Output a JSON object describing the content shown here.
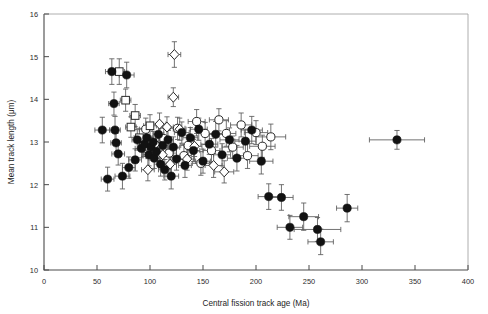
{
  "chart_data": {
    "type": "scatter",
    "title": "",
    "xlabel": "Central fission track age (Ma)",
    "ylabel": "Mean track length (μm)",
    "xlim": [
      0,
      400
    ],
    "ylim": [
      10,
      16
    ],
    "xticks": [
      0,
      50,
      100,
      150,
      200,
      250,
      300,
      350,
      400
    ],
    "yticks": [
      10,
      11,
      12,
      13,
      14,
      15,
      16
    ],
    "xticklabels": [
      "0",
      "50",
      "100",
      "150",
      "200",
      "250",
      "300",
      "350",
      "400"
    ],
    "yticklabels": [
      "10",
      "11",
      "12",
      "13",
      "14",
      "15",
      "16"
    ],
    "grid": false,
    "legend": "none",
    "error_bars": "x and y",
    "marker_types": [
      "filled-circle",
      "open-circle",
      "open-square",
      "open-diamond"
    ],
    "series": [
      {
        "name": "filled-circle",
        "marker": "filled-circle",
        "points": [
          {
            "x": 55,
            "y": 13.28,
            "xerr": 7,
            "yerr": 0.3
          },
          {
            "x": 60,
            "y": 12.13,
            "xerr": 6,
            "yerr": 0.28
          },
          {
            "x": 64,
            "y": 14.65,
            "xerr": 6,
            "yerr": 0.3
          },
          {
            "x": 66,
            "y": 13.9,
            "xerr": 5,
            "yerr": 0.27
          },
          {
            "x": 67,
            "y": 13.28,
            "xerr": 5,
            "yerr": 0.32
          },
          {
            "x": 68,
            "y": 12.98,
            "xerr": 5,
            "yerr": 0.22
          },
          {
            "x": 70,
            "y": 12.72,
            "xerr": 6,
            "yerr": 0.26
          },
          {
            "x": 74,
            "y": 12.2,
            "xerr": 7,
            "yerr": 0.3
          },
          {
            "x": 78,
            "y": 14.57,
            "xerr": 7,
            "yerr": 0.3
          },
          {
            "x": 80,
            "y": 12.4,
            "xerr": 6,
            "yerr": 0.25
          },
          {
            "x": 86,
            "y": 12.58,
            "xerr": 6,
            "yerr": 0.26
          },
          {
            "x": 88,
            "y": 13.05,
            "xerr": 5,
            "yerr": 0.24
          },
          {
            "x": 92,
            "y": 12.85,
            "xerr": 6,
            "yerr": 0.22
          },
          {
            "x": 95,
            "y": 12.95,
            "xerr": 5,
            "yerr": 0.2
          },
          {
            "x": 97,
            "y": 13.1,
            "xerr": 5,
            "yerr": 0.24
          },
          {
            "x": 99,
            "y": 12.7,
            "xerr": 6,
            "yerr": 0.26
          },
          {
            "x": 101,
            "y": 12.88,
            "xerr": 5,
            "yerr": 0.22
          },
          {
            "x": 103,
            "y": 13.0,
            "xerr": 6,
            "yerr": 0.25
          },
          {
            "x": 104,
            "y": 12.62,
            "xerr": 5,
            "yerr": 0.24
          },
          {
            "x": 106,
            "y": 12.78,
            "xerr": 6,
            "yerr": 0.22
          },
          {
            "x": 108,
            "y": 13.18,
            "xerr": 5,
            "yerr": 0.26
          },
          {
            "x": 110,
            "y": 12.48,
            "xerr": 6,
            "yerr": 0.28
          },
          {
            "x": 112,
            "y": 12.92,
            "xerr": 5,
            "yerr": 0.22
          },
          {
            "x": 114,
            "y": 12.35,
            "xerr": 6,
            "yerr": 0.24
          },
          {
            "x": 117,
            "y": 13.05,
            "xerr": 5,
            "yerr": 0.22
          },
          {
            "x": 120,
            "y": 12.2,
            "xerr": 7,
            "yerr": 0.3
          },
          {
            "x": 122,
            "y": 12.88,
            "xerr": 6,
            "yerr": 0.24
          },
          {
            "x": 125,
            "y": 12.6,
            "xerr": 6,
            "yerr": 0.26
          },
          {
            "x": 130,
            "y": 13.22,
            "xerr": 7,
            "yerr": 0.25
          },
          {
            "x": 133,
            "y": 12.45,
            "xerr": 6,
            "yerr": 0.28
          },
          {
            "x": 138,
            "y": 13.1,
            "xerr": 7,
            "yerr": 0.24
          },
          {
            "x": 141,
            "y": 12.8,
            "xerr": 6,
            "yerr": 0.26
          },
          {
            "x": 146,
            "y": 13.3,
            "xerr": 8,
            "yerr": 0.26
          },
          {
            "x": 150,
            "y": 12.55,
            "xerr": 7,
            "yerr": 0.28
          },
          {
            "x": 156,
            "y": 12.95,
            "xerr": 8,
            "yerr": 0.24
          },
          {
            "x": 162,
            "y": 13.18,
            "xerr": 8,
            "yerr": 0.3
          },
          {
            "x": 168,
            "y": 12.7,
            "xerr": 8,
            "yerr": 0.26
          },
          {
            "x": 175,
            "y": 13.05,
            "xerr": 9,
            "yerr": 0.28
          },
          {
            "x": 182,
            "y": 12.62,
            "xerr": 9,
            "yerr": 0.3
          },
          {
            "x": 190,
            "y": 13.02,
            "xerr": 10,
            "yerr": 0.28
          },
          {
            "x": 196,
            "y": 13.28,
            "xerr": 10,
            "yerr": 0.32
          },
          {
            "x": 205,
            "y": 12.55,
            "xerr": 11,
            "yerr": 0.3
          },
          {
            "x": 212,
            "y": 11.72,
            "xerr": 10,
            "yerr": 0.3
          },
          {
            "x": 224,
            "y": 11.7,
            "xerr": 11,
            "yerr": 0.3
          },
          {
            "x": 232,
            "y": 11.0,
            "xerr": 12,
            "yerr": 0.28
          },
          {
            "x": 245,
            "y": 11.25,
            "xerr": 14,
            "yerr": 0.32
          },
          {
            "x": 258,
            "y": 10.95,
            "xerr": 22,
            "yerr": 0.28
          },
          {
            "x": 261,
            "y": 10.66,
            "xerr": 12,
            "yerr": 0.3
          },
          {
            "x": 286,
            "y": 11.45,
            "xerr": 10,
            "yerr": 0.32
          },
          {
            "x": 333,
            "y": 13.05,
            "xerr": 26,
            "yerr": 0.22
          }
        ]
      },
      {
        "name": "open-circle",
        "marker": "open-circle",
        "points": [
          {
            "x": 96,
            "y": 13.3,
            "xerr": 6,
            "yerr": 0.26
          },
          {
            "x": 113,
            "y": 13.08,
            "xerr": 7,
            "yerr": 0.24
          },
          {
            "x": 126,
            "y": 13.32,
            "xerr": 7,
            "yerr": 0.26
          },
          {
            "x": 136,
            "y": 12.92,
            "xerr": 7,
            "yerr": 0.24
          },
          {
            "x": 144,
            "y": 13.48,
            "xerr": 8,
            "yerr": 0.28
          },
          {
            "x": 152,
            "y": 13.2,
            "xerr": 8,
            "yerr": 0.26
          },
          {
            "x": 158,
            "y": 12.8,
            "xerr": 8,
            "yerr": 0.28
          },
          {
            "x": 165,
            "y": 13.52,
            "xerr": 9,
            "yerr": 0.26
          },
          {
            "x": 172,
            "y": 13.2,
            "xerr": 9,
            "yerr": 0.3
          },
          {
            "x": 178,
            "y": 12.88,
            "xerr": 10,
            "yerr": 0.26
          },
          {
            "x": 186,
            "y": 13.4,
            "xerr": 10,
            "yerr": 0.28
          },
          {
            "x": 192,
            "y": 12.68,
            "xerr": 10,
            "yerr": 0.3
          },
          {
            "x": 200,
            "y": 13.22,
            "xerr": 11,
            "yerr": 0.28
          },
          {
            "x": 206,
            "y": 12.9,
            "xerr": 12,
            "yerr": 0.26
          },
          {
            "x": 214,
            "y": 13.12,
            "xerr": 14,
            "yerr": 0.3
          },
          {
            "x": 148,
            "y": 12.5,
            "xerr": 8,
            "yerr": 0.28
          },
          {
            "x": 132,
            "y": 12.68,
            "xerr": 7,
            "yerr": 0.26
          },
          {
            "x": 118,
            "y": 12.74,
            "xerr": 7,
            "yerr": 0.24
          }
        ]
      },
      {
        "name": "open-square",
        "marker": "open-square",
        "points": [
          {
            "x": 71,
            "y": 14.65,
            "xerr": 5,
            "yerr": 0.3
          },
          {
            "x": 77,
            "y": 13.98,
            "xerr": 5,
            "yerr": 0.26
          },
          {
            "x": 82,
            "y": 13.35,
            "xerr": 5,
            "yerr": 0.24
          },
          {
            "x": 86,
            "y": 13.62,
            "xerr": 5,
            "yerr": 0.26
          },
          {
            "x": 90,
            "y": 13.1,
            "xerr": 5,
            "yerr": 0.22
          },
          {
            "x": 94,
            "y": 12.9,
            "xerr": 5,
            "yerr": 0.24
          },
          {
            "x": 100,
            "y": 13.38,
            "xerr": 6,
            "yerr": 0.26
          }
        ]
      },
      {
        "name": "open-diamond",
        "marker": "open-diamond",
        "points": [
          {
            "x": 123,
            "y": 15.05,
            "xerr": 6,
            "yerr": 0.3
          },
          {
            "x": 122,
            "y": 14.05,
            "xerr": 5,
            "yerr": 0.22
          },
          {
            "x": 109,
            "y": 13.42,
            "xerr": 6,
            "yerr": 0.26
          },
          {
            "x": 116,
            "y": 13.35,
            "xerr": 6,
            "yerr": 0.24
          },
          {
            "x": 128,
            "y": 13.3,
            "xerr": 6,
            "yerr": 0.26
          },
          {
            "x": 105,
            "y": 12.95,
            "xerr": 5,
            "yerr": 0.24
          },
          {
            "x": 112,
            "y": 12.7,
            "xerr": 6,
            "yerr": 0.26
          },
          {
            "x": 119,
            "y": 12.48,
            "xerr": 6,
            "yerr": 0.28
          },
          {
            "x": 98,
            "y": 12.35,
            "xerr": 6,
            "yerr": 0.26
          },
          {
            "x": 135,
            "y": 12.6,
            "xerr": 7,
            "yerr": 0.26
          },
          {
            "x": 142,
            "y": 12.9,
            "xerr": 7,
            "yerr": 0.24
          },
          {
            "x": 160,
            "y": 12.45,
            "xerr": 8,
            "yerr": 0.28
          },
          {
            "x": 170,
            "y": 12.3,
            "xerr": 9,
            "yerr": 0.26
          }
        ]
      }
    ]
  }
}
